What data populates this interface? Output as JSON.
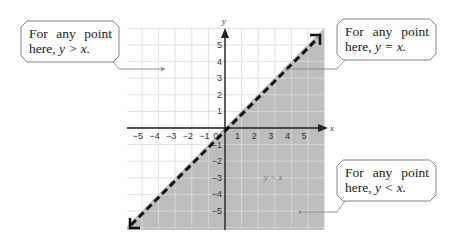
{
  "diagram": {
    "type": "linear-inequality-graph",
    "boundary": "y = x",
    "boundary_style": "dashed",
    "shaded_region": "y < x",
    "colors": {
      "shade": "#bdbdbd",
      "grid": "#dddddd",
      "axis": "#222222",
      "boundary": "#111111",
      "callout_border": "#777777",
      "pointer": "#8a8a8a"
    },
    "axes": {
      "x_label": "x",
      "y_label": "y",
      "x_ticks": [
        "−5",
        "−4",
        "−3",
        "−2",
        "−1",
        "0",
        "1",
        "2",
        "3",
        "4",
        "5"
      ],
      "y_ticks": [
        "5",
        "4",
        "3",
        "2",
        "1",
        "−1",
        "−2",
        "−3",
        "−4",
        "−5"
      ]
    },
    "region_label": "y < x"
  },
  "callouts": {
    "above": {
      "text": "For any point here,",
      "rel": "y > x."
    },
    "on_line": {
      "text": "For any point here,",
      "rel": "y = x."
    },
    "below": {
      "text": "For any point here,",
      "rel": "y < x."
    }
  }
}
